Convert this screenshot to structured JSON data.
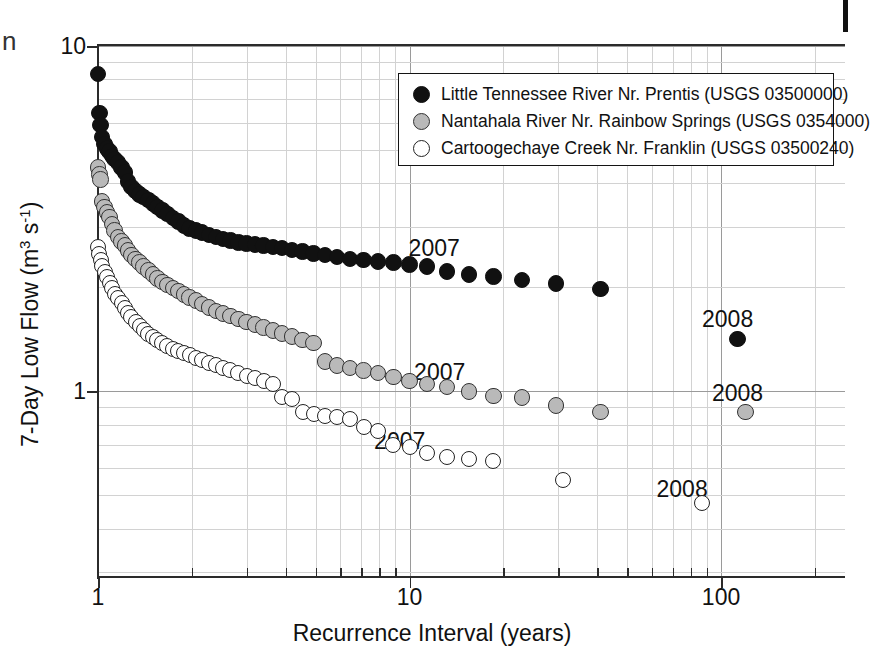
{
  "figure": {
    "background": "#ffffff",
    "artifact_left_glyph": "n",
    "colors": {
      "series_prentis": "#111111",
      "series_nantahala": "#b9b9b9",
      "series_cartoogechaye": "#ffffff",
      "axis": "#2b2b2b",
      "grid_major": "#9a9a9a",
      "grid_minor": "#d2d2d2"
    }
  },
  "legend": {
    "position": "upper-right",
    "entries": [
      {
        "marker": "filled-circle-black",
        "label": "Little Tennessee River Nr. Prentis (USGS 03500000)"
      },
      {
        "marker": "filled-circle-gray",
        "label": "Nantahala River Nr. Rainbow Springs (USGS 0354000)"
      },
      {
        "marker": "open-circle",
        "label": "Cartoogechaye Creek Nr. Franklin (USGS 03500240)"
      }
    ]
  },
  "chart_data": {
    "type": "scatter",
    "title": "",
    "xlabel": "Recurrence Interval (years)",
    "ylabel": "7-Day Low Flow (m3 s-1)",
    "ylabel_parts": {
      "prefix": "7-Day Low Flow (m",
      "sup1": "3",
      "mid": " s",
      "sup2": "-1",
      "suffix": ")"
    },
    "xscale": "log",
    "yscale": "log",
    "xlim": [
      1,
      250
    ],
    "ylim": [
      0.29,
      10
    ],
    "grid": true,
    "xticks": [
      1,
      10,
      100
    ],
    "xticklabels": [
      "1",
      "10",
      "100"
    ],
    "yticks": [
      1,
      10
    ],
    "yticklabels": [
      "1",
      "10"
    ],
    "x_minor_ticks": [
      2,
      3,
      4,
      5,
      6,
      7,
      8,
      9,
      20,
      30,
      40,
      50,
      60,
      70,
      80,
      90,
      200
    ],
    "y_minor_ticks": [
      0.3,
      0.4,
      0.5,
      0.6,
      0.7,
      0.8,
      0.9,
      2,
      3,
      4,
      5,
      6,
      7,
      8,
      9
    ],
    "annotations": [
      {
        "text": "2007",
        "x": 12.0,
        "y": 2.6,
        "series": "Little Tennessee River Nr. Prentis"
      },
      {
        "text": "2008",
        "x": 105.0,
        "y": 1.62,
        "series": "Little Tennessee River Nr. Prentis"
      },
      {
        "text": "2007",
        "x": 12.5,
        "y": 1.14,
        "series": "Nantahala River Nr. Rainbow Springs"
      },
      {
        "text": "2008",
        "x": 113.0,
        "y": 0.99,
        "series": "Nantahala River Nr. Rainbow Springs"
      },
      {
        "text": "2007",
        "x": 9.3,
        "y": 0.72,
        "series": "Cartoogechaye Creek Nr. Franklin"
      },
      {
        "text": "2008",
        "x": 75.0,
        "y": 0.52,
        "series": "Cartoogechaye Creek Nr. Franklin"
      }
    ],
    "series": [
      {
        "name": "Little Tennessee River Nr. Prentis (USGS 03500000)",
        "marker": "filled-circle-black",
        "points": [
          [
            1.0,
            8.3
          ],
          [
            1.01,
            6.4
          ],
          [
            1.02,
            5.9
          ],
          [
            1.03,
            5.45
          ],
          [
            1.05,
            5.2
          ],
          [
            1.07,
            5.05
          ],
          [
            1.09,
            4.95
          ],
          [
            1.11,
            4.8
          ],
          [
            1.13,
            4.7
          ],
          [
            1.16,
            4.6
          ],
          [
            1.19,
            4.45
          ],
          [
            1.22,
            4.3
          ],
          [
            1.25,
            4.05
          ],
          [
            1.28,
            3.9
          ],
          [
            1.32,
            3.8
          ],
          [
            1.36,
            3.72
          ],
          [
            1.4,
            3.65
          ],
          [
            1.45,
            3.58
          ],
          [
            1.5,
            3.5
          ],
          [
            1.55,
            3.42
          ],
          [
            1.61,
            3.34
          ],
          [
            1.67,
            3.26
          ],
          [
            1.74,
            3.18
          ],
          [
            1.81,
            3.1
          ],
          [
            1.89,
            3.02
          ],
          [
            1.97,
            2.96
          ],
          [
            2.06,
            2.92
          ],
          [
            2.16,
            2.88
          ],
          [
            2.27,
            2.84
          ],
          [
            2.39,
            2.8
          ],
          [
            2.52,
            2.76
          ],
          [
            2.66,
            2.73
          ],
          [
            2.82,
            2.7
          ],
          [
            3.0,
            2.68
          ],
          [
            3.19,
            2.66
          ],
          [
            3.4,
            2.64
          ],
          [
            3.64,
            2.62
          ],
          [
            3.9,
            2.6
          ],
          [
            4.2,
            2.57
          ],
          [
            4.54,
            2.54
          ],
          [
            4.92,
            2.51
          ],
          [
            5.36,
            2.48
          ],
          [
            5.86,
            2.45
          ],
          [
            6.44,
            2.42
          ],
          [
            7.12,
            2.4
          ],
          [
            7.92,
            2.38
          ],
          [
            8.88,
            2.36
          ],
          [
            10.0,
            2.33
          ],
          [
            11.4,
            2.3
          ],
          [
            13.2,
            2.22
          ],
          [
            15.5,
            2.18
          ],
          [
            18.6,
            2.15
          ],
          [
            23.0,
            2.1
          ],
          [
            29.5,
            2.05
          ],
          [
            41.0,
            1.98
          ],
          [
            113.0,
            1.42
          ]
        ]
      },
      {
        "name": "Nantahala River Nr. Rainbow Springs (USGS 0354000)",
        "marker": "filled-circle-gray",
        "points": [
          [
            1.0,
            4.45
          ],
          [
            1.01,
            4.25
          ],
          [
            1.02,
            4.1
          ],
          [
            1.03,
            3.55
          ],
          [
            1.05,
            3.42
          ],
          [
            1.07,
            3.3
          ],
          [
            1.09,
            3.2
          ],
          [
            1.11,
            3.05
          ],
          [
            1.13,
            2.92
          ],
          [
            1.16,
            2.8
          ],
          [
            1.19,
            2.72
          ],
          [
            1.22,
            2.64
          ],
          [
            1.25,
            2.56
          ],
          [
            1.28,
            2.48
          ],
          [
            1.32,
            2.42
          ],
          [
            1.36,
            2.36
          ],
          [
            1.4,
            2.3
          ],
          [
            1.45,
            2.24
          ],
          [
            1.5,
            2.18
          ],
          [
            1.55,
            2.12
          ],
          [
            1.61,
            2.07
          ],
          [
            1.67,
            2.03
          ],
          [
            1.74,
            1.99
          ],
          [
            1.81,
            1.95
          ],
          [
            1.89,
            1.91
          ],
          [
            1.97,
            1.87
          ],
          [
            2.06,
            1.83
          ],
          [
            2.16,
            1.79
          ],
          [
            2.27,
            1.75
          ],
          [
            2.39,
            1.71
          ],
          [
            2.52,
            1.68
          ],
          [
            2.66,
            1.65
          ],
          [
            2.82,
            1.62
          ],
          [
            3.0,
            1.59
          ],
          [
            3.19,
            1.56
          ],
          [
            3.4,
            1.53
          ],
          [
            3.64,
            1.5
          ],
          [
            3.9,
            1.47
          ],
          [
            4.2,
            1.44
          ],
          [
            4.54,
            1.41
          ],
          [
            4.92,
            1.38
          ],
          [
            5.36,
            1.22
          ],
          [
            5.86,
            1.19
          ],
          [
            6.44,
            1.17
          ],
          [
            7.12,
            1.15
          ],
          [
            7.92,
            1.13
          ],
          [
            8.88,
            1.1
          ],
          [
            10.0,
            1.07
          ],
          [
            11.4,
            1.05
          ],
          [
            13.2,
            1.03
          ],
          [
            15.5,
            1.0
          ],
          [
            18.6,
            0.97
          ],
          [
            23.0,
            0.96
          ],
          [
            29.5,
            0.91
          ],
          [
            41.0,
            0.87
          ],
          [
            120.0,
            0.87
          ]
        ]
      },
      {
        "name": "Cartoogechaye Creek Nr. Franklin (USGS 03500240)",
        "marker": "open-circle",
        "points": [
          [
            1.0,
            2.62
          ],
          [
            1.01,
            2.5
          ],
          [
            1.02,
            2.4
          ],
          [
            1.03,
            2.3
          ],
          [
            1.05,
            2.22
          ],
          [
            1.07,
            2.14
          ],
          [
            1.09,
            2.06
          ],
          [
            1.11,
            1.99
          ],
          [
            1.13,
            1.92
          ],
          [
            1.16,
            1.86
          ],
          [
            1.19,
            1.8
          ],
          [
            1.22,
            1.74
          ],
          [
            1.25,
            1.69
          ],
          [
            1.28,
            1.64
          ],
          [
            1.32,
            1.59
          ],
          [
            1.36,
            1.55
          ],
          [
            1.4,
            1.51
          ],
          [
            1.45,
            1.47
          ],
          [
            1.5,
            1.44
          ],
          [
            1.55,
            1.41
          ],
          [
            1.61,
            1.38
          ],
          [
            1.67,
            1.35
          ],
          [
            1.74,
            1.33
          ],
          [
            1.81,
            1.31
          ],
          [
            1.89,
            1.29
          ],
          [
            1.97,
            1.27
          ],
          [
            2.06,
            1.25
          ],
          [
            2.16,
            1.23
          ],
          [
            2.27,
            1.21
          ],
          [
            2.39,
            1.19
          ],
          [
            2.52,
            1.17
          ],
          [
            2.66,
            1.15
          ],
          [
            2.82,
            1.13
          ],
          [
            3.0,
            1.11
          ],
          [
            3.19,
            1.09
          ],
          [
            3.4,
            1.07
          ],
          [
            3.64,
            1.05
          ],
          [
            3.9,
            0.96
          ],
          [
            4.2,
            0.95
          ],
          [
            4.54,
            0.87
          ],
          [
            4.92,
            0.86
          ],
          [
            5.36,
            0.85
          ],
          [
            5.86,
            0.84
          ],
          [
            6.44,
            0.83
          ],
          [
            7.12,
            0.79
          ],
          [
            7.92,
            0.77
          ],
          [
            8.88,
            0.7
          ],
          [
            10.0,
            0.69
          ],
          [
            11.4,
            0.665
          ],
          [
            13.2,
            0.645
          ],
          [
            15.5,
            0.635
          ],
          [
            18.6,
            0.63
          ],
          [
            31.0,
            0.555
          ],
          [
            87.0,
            0.475
          ]
        ]
      }
    ]
  }
}
